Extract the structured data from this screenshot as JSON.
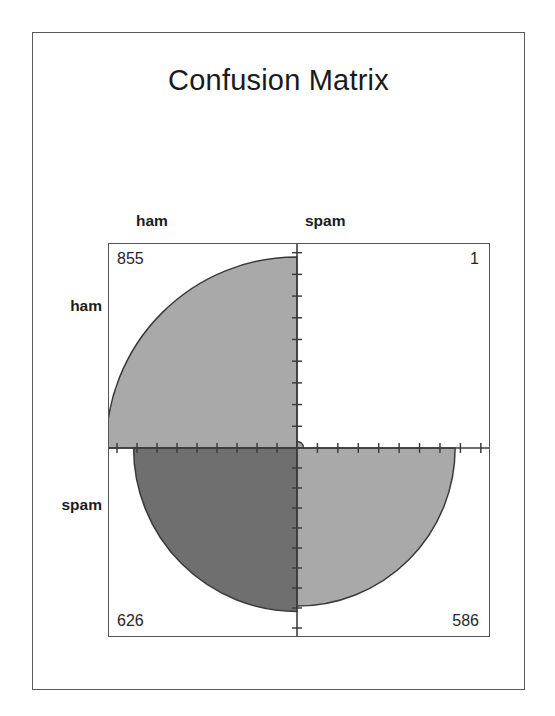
{
  "chart_data": {
    "type": "heatmap",
    "plot_kind": "fourfold-plot",
    "title": "Confusion Matrix",
    "xlabel": "",
    "ylabel": "",
    "row_labels": [
      "ham",
      "spam"
    ],
    "col_labels": [
      "ham",
      "spam"
    ],
    "cells": [
      {
        "row": "ham",
        "col": "ham",
        "value": 855,
        "quadrant": "top-left",
        "shade": "#a9a9a9"
      },
      {
        "row": "ham",
        "col": "spam",
        "value": 1,
        "quadrant": "top-right",
        "shade": "#a9a9a9"
      },
      {
        "row": "spam",
        "col": "ham",
        "value": 626,
        "quadrant": "bottom-left",
        "shade": "#6f6f6f"
      },
      {
        "row": "spam",
        "col": "spam",
        "value": 586,
        "quadrant": "bottom-right",
        "shade": "#a9a9a9"
      }
    ],
    "values": [
      [
        855,
        1
      ],
      [
        626,
        586
      ]
    ],
    "grid": false,
    "legend": "none",
    "axis_ticks_per_half": 9,
    "colors": {
      "light_gray": "#a9a9a9",
      "dark_gray": "#6f6f6f",
      "arc_outline": "#3a3a3a",
      "axis": "#3d3d3d",
      "frame": "#555555",
      "outer_frame": "#5a5a5a",
      "text": "#1c1c1c",
      "background": "#ffffff"
    }
  },
  "title": {
    "text": "Confusion Matrix"
  },
  "labels": {
    "col_ham": "ham",
    "col_spam": "spam",
    "row_ham": "ham",
    "row_spam": "spam"
  },
  "counts": {
    "ham_ham": "855",
    "ham_spam": "1",
    "spam_ham": "626",
    "spam_spam": "586"
  }
}
